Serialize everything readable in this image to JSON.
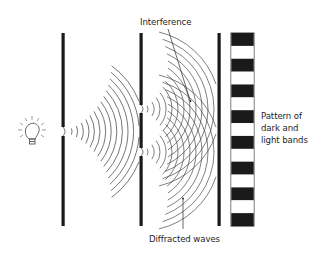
{
  "figure": {
    "labels": {
      "interference": "Interference",
      "diffracted_waves": "Diffracted waves",
      "pattern_line1": "Pattern of",
      "pattern_line2": "dark and",
      "pattern_line3": "light bands"
    },
    "components": {
      "light_source": "light-bulb",
      "barriers": [
        {
          "name": "single-slit-barrier",
          "slits": 1
        },
        {
          "name": "double-slit-barrier",
          "slits": 2
        },
        {
          "name": "screen-barrier",
          "slits": 0
        }
      ],
      "band_pattern": [
        "dark",
        "light",
        "dark",
        "light",
        "dark",
        "light",
        "dark",
        "light",
        "dark",
        "light",
        "dark",
        "light",
        "dark",
        "light",
        "dark"
      ]
    },
    "colors": {
      "ink": "#1a1a1a",
      "background": "#ffffff"
    }
  }
}
